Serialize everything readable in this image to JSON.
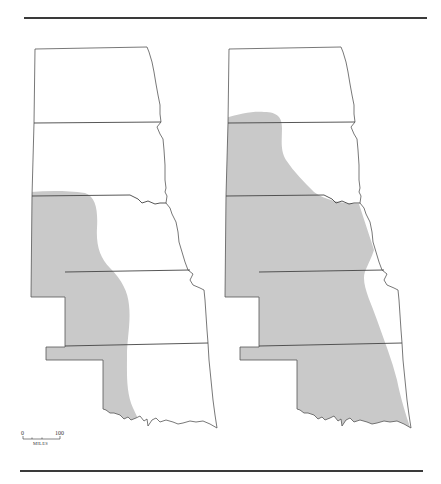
{
  "figure": {
    "maps": [
      {
        "id": "left",
        "description": "Northern-to-southern Great Plains states outline (Dakotas, Nebraska, Kansas, Oklahoma) with western shaded range",
        "shaded_region": "western portion"
      },
      {
        "id": "right",
        "description": "Same state outlines with broader shaded range covering most of region",
        "shaded_region": "most of region except northeast"
      }
    ],
    "states": [
      "North Dakota",
      "South Dakota",
      "Nebraska",
      "Kansas",
      "Oklahoma"
    ],
    "scale_bar": {
      "start_label": "0",
      "end_label": "100",
      "unit_label": "MILES"
    },
    "colors": {
      "shade": "#c9c9c9",
      "outline": "#555555",
      "rule": "#3a3a3a"
    }
  }
}
